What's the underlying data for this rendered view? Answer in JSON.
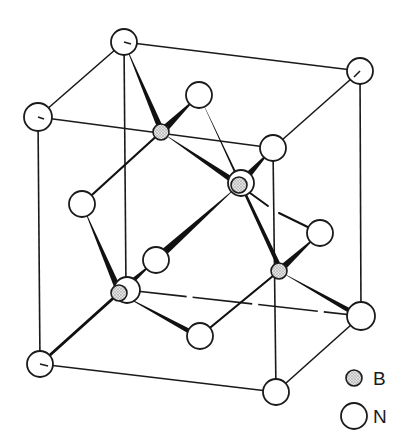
{
  "diagram": {
    "type": "crystal-structure",
    "structure": "zinc-blende (cubic boron nitride) unit cell",
    "colors": {
      "line": "#1a1a1a",
      "n_fill": "#ffffff",
      "b_fill": "#c8c8c8",
      "background": "#ffffff"
    },
    "n_atoms": [
      {
        "id": "TBL",
        "x": 124,
        "y": 42,
        "r": 13
      },
      {
        "id": "TBR",
        "x": 360,
        "y": 71,
        "r": 13
      },
      {
        "id": "TFL",
        "x": 38,
        "y": 117,
        "r": 14
      },
      {
        "id": "TFR",
        "x": 273,
        "y": 148,
        "r": 13
      },
      {
        "id": "BBL",
        "x": 127,
        "y": 290,
        "r": 13
      },
      {
        "id": "BBR",
        "x": 361,
        "y": 316,
        "r": 14
      },
      {
        "id": "BFL",
        "x": 40,
        "y": 364,
        "r": 13
      },
      {
        "id": "BFR",
        "x": 276,
        "y": 392,
        "r": 13
      },
      {
        "id": "top-face",
        "x": 199,
        "y": 95,
        "r": 13
      },
      {
        "id": "back-face",
        "x": 241,
        "y": 183,
        "r": 13
      },
      {
        "id": "left-face",
        "x": 82,
        "y": 204,
        "r": 13
      },
      {
        "id": "right-face",
        "x": 320,
        "y": 233,
        "r": 13
      },
      {
        "id": "front-face",
        "x": 156,
        "y": 260,
        "r": 13
      },
      {
        "id": "bottom-face",
        "x": 200,
        "y": 336,
        "r": 13
      }
    ],
    "b_atoms": [
      {
        "id": "B1",
        "x": 161,
        "y": 132,
        "r": 8
      },
      {
        "id": "B2",
        "x": 239,
        "y": 185,
        "r": 8
      },
      {
        "id": "B3",
        "x": 279,
        "y": 271,
        "r": 8
      },
      {
        "id": "B4",
        "x": 119,
        "y": 293,
        "r": 8
      }
    ]
  },
  "legend": {
    "items": [
      {
        "symbol": "B",
        "label": "B",
        "atom": "boron"
      },
      {
        "symbol": "N",
        "label": "N",
        "atom": "nitrogen"
      }
    ]
  }
}
